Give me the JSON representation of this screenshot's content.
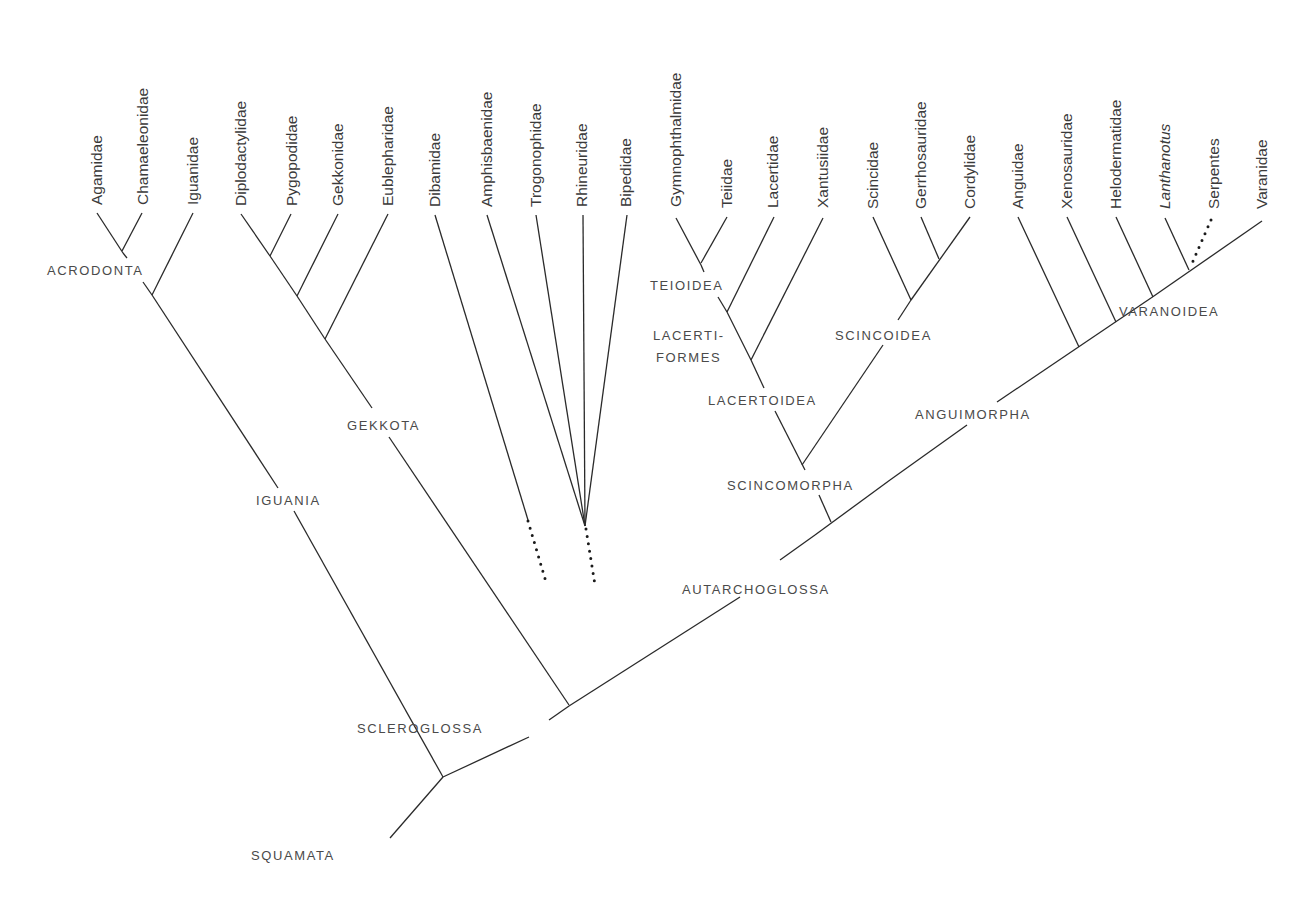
{
  "figure": {
    "line_color": "#2a2a2a",
    "text_color": "#3a3a3a"
  },
  "taxa": [
    {
      "id": "agamidae",
      "label": "Agamidae",
      "italic": false,
      "x": 97,
      "tip_y": 213
    },
    {
      "id": "chamaeleonidae",
      "label": "Chamaeleonidae",
      "italic": false,
      "x": 143,
      "tip_y": 213
    },
    {
      "id": "iguanidae",
      "label": "Iguanidae",
      "italic": false,
      "x": 193,
      "tip_y": 213
    },
    {
      "id": "diplodactylidae",
      "label": "Diplodactylidae",
      "italic": false,
      "x": 241,
      "tip_y": 214
    },
    {
      "id": "pygopodidae",
      "label": "Pygopodidae",
      "italic": false,
      "x": 292,
      "tip_y": 214
    },
    {
      "id": "gekkonidae",
      "label": "Gekkonidae",
      "italic": false,
      "x": 338,
      "tip_y": 214
    },
    {
      "id": "eublepharidae",
      "label": "Eublepharidae",
      "italic": false,
      "x": 388,
      "tip_y": 214
    },
    {
      "id": "dibamidae",
      "label": "Dibamidae",
      "italic": false,
      "x": 435,
      "tip_y": 215
    },
    {
      "id": "amphisbaenidae",
      "label": "Amphisbaenidae",
      "italic": false,
      "x": 487,
      "tip_y": 215
    },
    {
      "id": "trogonophidae",
      "label": "Trogonophidae",
      "italic": false,
      "x": 536,
      "tip_y": 215
    },
    {
      "id": "rhineuridae",
      "label": "Rhineuridae",
      "italic": false,
      "x": 582,
      "tip_y": 215
    },
    {
      "id": "bipedidae",
      "label": "Bipedidae",
      "italic": false,
      "x": 626,
      "tip_y": 215
    },
    {
      "id": "gymnophthalmidae",
      "label": "Gymnophthalmidae",
      "italic": false,
      "x": 676,
      "tip_y": 215
    },
    {
      "id": "teiidae",
      "label": "Teiidae",
      "italic": false,
      "x": 727,
      "tip_y": 216
    },
    {
      "id": "lacertidae",
      "label": "Lacertidae",
      "italic": false,
      "x": 773,
      "tip_y": 216
    },
    {
      "id": "xantusiidae",
      "label": "Xantusiidae",
      "italic": false,
      "x": 823,
      "tip_y": 216
    },
    {
      "id": "scincidae",
      "label": "Scincidae",
      "italic": false,
      "x": 873,
      "tip_y": 217
    },
    {
      "id": "gerrhosauridae",
      "label": "Gerrhosauridae",
      "italic": false,
      "x": 921,
      "tip_y": 217
    },
    {
      "id": "cordylidae",
      "label": "Cordylidae",
      "italic": false,
      "x": 970,
      "tip_y": 217
    },
    {
      "id": "anguidae",
      "label": "Anguidae",
      "italic": false,
      "x": 1018,
      "tip_y": 217
    },
    {
      "id": "xenosauridae",
      "label": "Xenosauridae",
      "italic": false,
      "x": 1067,
      "tip_y": 217
    },
    {
      "id": "helodermatidae",
      "label": "Helodermatidae",
      "italic": false,
      "x": 1116,
      "tip_y": 217
    },
    {
      "id": "lanthanotus",
      "label": "Lanthanotus",
      "italic": true,
      "x": 1165,
      "tip_y": 217
    },
    {
      "id": "serpentes",
      "label": "Serpentes",
      "italic": false,
      "x": 1214,
      "tip_y": 217
    },
    {
      "id": "varanidae",
      "label": "Varanidae",
      "italic": false,
      "x": 1262,
      "tip_y": 217
    }
  ],
  "clades": [
    {
      "id": "acrodonta",
      "label": "ACRODONTA",
      "x": 47,
      "y": 275
    },
    {
      "id": "iguania",
      "label": "IGUANIA",
      "x": 256,
      "y": 505
    },
    {
      "id": "gekkota",
      "label": "GEKKOTA",
      "x": 347,
      "y": 430
    },
    {
      "id": "teioidea",
      "label": "TEIOIDEA",
      "x": 650,
      "y": 290
    },
    {
      "id": "lacertiformes_1",
      "label": "LACERTI-",
      "x": 653,
      "y": 340
    },
    {
      "id": "lacertiformes_2",
      "label": "FORMES",
      "x": 656,
      "y": 362
    },
    {
      "id": "lacertoidea",
      "label": "LACERTOIDEA",
      "x": 708,
      "y": 405
    },
    {
      "id": "scincoidea",
      "label": "SCINCOIDEA",
      "x": 835,
      "y": 340
    },
    {
      "id": "scincomorpha",
      "label": "SCINCOMORPHA",
      "x": 727,
      "y": 490
    },
    {
      "id": "anguimorpha",
      "label": "ANGUIMORPHA",
      "x": 915,
      "y": 419
    },
    {
      "id": "varanoidea",
      "label": "VARANOIDEA",
      "x": 1119,
      "y": 316
    },
    {
      "id": "autarchoglossa",
      "label": "AUTARCHOGLOSSA",
      "x": 682,
      "y": 594
    },
    {
      "id": "scleroglossa",
      "label": "SCLEROGLOSSA",
      "x": 357,
      "y": 733
    },
    {
      "id": "squamata",
      "label": "SQUAMATA",
      "x": 251,
      "y": 860
    }
  ],
  "branches": [
    {
      "id": "agamidae-stem",
      "x1": 97,
      "y1": 213,
      "x2": 123,
      "y2": 253
    },
    {
      "id": "chamaeleonidae-stem",
      "x1": 142,
      "y1": 213,
      "x2": 122,
      "y2": 251
    },
    {
      "id": "acrodonta-stem",
      "x1": 123,
      "y1": 253,
      "x2": 127,
      "y2": 258
    },
    {
      "id": "acrodonta-stem-lower",
      "x1": 143,
      "y1": 282,
      "x2": 152,
      "y2": 295
    },
    {
      "id": "iguanidae-stem",
      "x1": 193,
      "y1": 213,
      "x2": 152,
      "y2": 295
    },
    {
      "id": "iguania-upper",
      "x1": 152,
      "y1": 295,
      "x2": 278,
      "y2": 488
    },
    {
      "id": "iguania-lower",
      "x1": 294,
      "y1": 511,
      "x2": 443,
      "y2": 777
    },
    {
      "id": "diplodactylidae-stem",
      "x1": 241,
      "y1": 214,
      "x2": 270,
      "y2": 256
    },
    {
      "id": "pygopodidae-stem",
      "x1": 291,
      "y1": 214,
      "x2": 270,
      "y2": 256
    },
    {
      "id": "gekkota-a",
      "x1": 270,
      "y1": 256,
      "x2": 297,
      "y2": 296
    },
    {
      "id": "gekkonidae-stem",
      "x1": 338,
      "y1": 214,
      "x2": 297,
      "y2": 296
    },
    {
      "id": "gekkota-b",
      "x1": 297,
      "y1": 296,
      "x2": 325,
      "y2": 339
    },
    {
      "id": "eublepharidae-stem",
      "x1": 388,
      "y1": 214,
      "x2": 325,
      "y2": 339
    },
    {
      "id": "gekkota-upper",
      "x1": 325,
      "y1": 339,
      "x2": 372,
      "y2": 408
    },
    {
      "id": "gekkota-lower",
      "x1": 389,
      "y1": 437,
      "x2": 569,
      "y2": 705
    },
    {
      "id": "dibamidae-stem",
      "x1": 435,
      "y1": 215,
      "x2": 528,
      "y2": 520
    },
    {
      "id": "amphisbaenidae-stem",
      "x1": 487,
      "y1": 215,
      "x2": 585,
      "y2": 526
    },
    {
      "id": "trogonophidae-stem",
      "x1": 536,
      "y1": 215,
      "x2": 585,
      "y2": 526
    },
    {
      "id": "rhineuridae-stem",
      "x1": 583,
      "y1": 215,
      "x2": 585,
      "y2": 526
    },
    {
      "id": "bipedidae-stem",
      "x1": 627,
      "y1": 215,
      "x2": 585,
      "y2": 526
    },
    {
      "id": "gymnophthalmidae-stem",
      "x1": 676,
      "y1": 218,
      "x2": 701,
      "y2": 265
    },
    {
      "id": "teiidae-stem",
      "x1": 727,
      "y1": 217,
      "x2": 701,
      "y2": 263
    },
    {
      "id": "teioidea-stem-top",
      "x1": 701,
      "y1": 265,
      "x2": 704,
      "y2": 272
    },
    {
      "id": "teioidea-stem",
      "x1": 718,
      "y1": 297,
      "x2": 727,
      "y2": 312
    },
    {
      "id": "lacertidae-stem",
      "x1": 774,
      "y1": 217,
      "x2": 727,
      "y2": 312
    },
    {
      "id": "lacertiformes-stem",
      "x1": 727,
      "y1": 312,
      "x2": 751,
      "y2": 360
    },
    {
      "id": "xantusiidae-stem",
      "x1": 823,
      "y1": 218,
      "x2": 751,
      "y2": 360
    },
    {
      "id": "lacertiformes-lower",
      "x1": 751,
      "y1": 360,
      "x2": 764,
      "y2": 388
    },
    {
      "id": "lacertoidea-stem",
      "x1": 775,
      "y1": 411,
      "x2": 805,
      "y2": 470
    },
    {
      "id": "scincidae-stem",
      "x1": 873,
      "y1": 217,
      "x2": 911,
      "y2": 300
    },
    {
      "id": "gerrhosauridae-stem",
      "x1": 921,
      "y1": 217,
      "x2": 939,
      "y2": 259
    },
    {
      "id": "cordylidae-stem",
      "x1": 970,
      "y1": 217,
      "x2": 911,
      "y2": 300
    },
    {
      "id": "scincoidea-top",
      "x1": 911,
      "y1": 300,
      "x2": 898,
      "y2": 320
    },
    {
      "id": "scincoidea-stem",
      "x1": 883,
      "y1": 345,
      "x2": 802,
      "y2": 465
    },
    {
      "id": "scincomorpha-stem",
      "x1": 819,
      "y1": 495,
      "x2": 831,
      "y2": 522
    },
    {
      "id": "anguidae-stem",
      "x1": 1018,
      "y1": 217,
      "x2": 1079,
      "y2": 347
    },
    {
      "id": "xenosauridae-stem",
      "x1": 1067,
      "y1": 217,
      "x2": 1116,
      "y2": 322
    },
    {
      "id": "helodermatidae-stem",
      "x1": 1116,
      "y1": 217,
      "x2": 1153,
      "y2": 297
    },
    {
      "id": "lanthanotus-stem",
      "x1": 1165,
      "y1": 218,
      "x2": 1189,
      "y2": 270
    },
    {
      "id": "varanidae-stem",
      "x1": 1262,
      "y1": 221,
      "x2": 1151,
      "y2": 298
    },
    {
      "id": "varanoidea-stem",
      "x1": 1151,
      "y1": 298,
      "x2": 1111,
      "y2": 325
    },
    {
      "id": "anguimorpha-upper",
      "x1": 1111,
      "y1": 325,
      "x2": 997,
      "y2": 402
    },
    {
      "id": "anguimorpha-lower",
      "x1": 967,
      "y1": 425,
      "x2": 890,
      "y2": 480
    },
    {
      "id": "autarchoglossa-upper",
      "x1": 890,
      "y1": 480,
      "x2": 815,
      "y2": 535
    },
    {
      "id": "autarchoglossa-lower",
      "x1": 815,
      "y1": 535,
      "x2": 780,
      "y2": 560
    },
    {
      "id": "autarchoglossa-stem",
      "x1": 740,
      "y1": 597,
      "x2": 569,
      "y2": 706
    },
    {
      "id": "scleroglossa-upper",
      "x1": 569,
      "y1": 706,
      "x2": 549,
      "y2": 720
    },
    {
      "id": "scleroglossa-lower",
      "x1": 529,
      "y1": 737,
      "x2": 443,
      "y2": 777
    },
    {
      "id": "squamata-stem",
      "x1": 443,
      "y1": 777,
      "x2": 390,
      "y2": 838
    }
  ],
  "dotted_branches": [
    {
      "id": "dibamidae-dotted",
      "x1": 528,
      "y1": 521,
      "x2": 546,
      "y2": 582
    },
    {
      "id": "amphisbaenia-dotted",
      "x1": 586,
      "y1": 529,
      "x2": 595,
      "y2": 585
    },
    {
      "id": "serpentes-dotted",
      "x1": 1211,
      "y1": 220,
      "x2": 1190,
      "y2": 268
    }
  ]
}
